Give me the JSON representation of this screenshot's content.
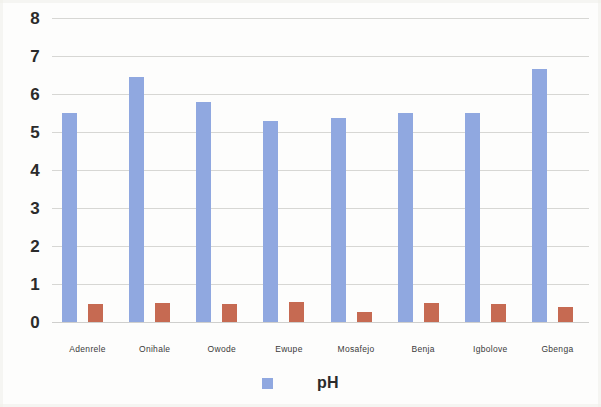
{
  "chart_data": {
    "type": "bar",
    "title": "",
    "xlabel": "",
    "ylabel": "",
    "ylim": [
      0,
      8
    ],
    "yticks": [
      0,
      1,
      2,
      3,
      4,
      5,
      6,
      7,
      8
    ],
    "ytick_labels": [
      "0",
      "1",
      "2",
      "3",
      "4",
      "5",
      "6",
      "7",
      "8"
    ],
    "grid": true,
    "legend_position": "bottom",
    "categories": [
      "Adenrele",
      "Onihale",
      "Owode",
      "Ewupe",
      "Mosafejo",
      "Benja",
      "Igbolove",
      "Gbenga"
    ],
    "series": [
      {
        "name": "pH",
        "color": "#90a8e0",
        "values": [
          5.5,
          6.45,
          5.78,
          5.3,
          5.38,
          5.5,
          5.5,
          6.65
        ]
      },
      {
        "name": "",
        "color": "#c66a52",
        "values": [
          0.47,
          0.5,
          0.48,
          0.52,
          0.26,
          0.5,
          0.48,
          0.4
        ]
      }
    ]
  },
  "legend": {
    "entries": [
      {
        "label": "pH",
        "color": "#90a8e0"
      }
    ]
  },
  "colors": {
    "series_ph": "#90a8e0",
    "series_second": "#c66a52",
    "gridline": "#c9c9c7",
    "text": "#2b2b2b",
    "background": "#fdfdfc"
  }
}
